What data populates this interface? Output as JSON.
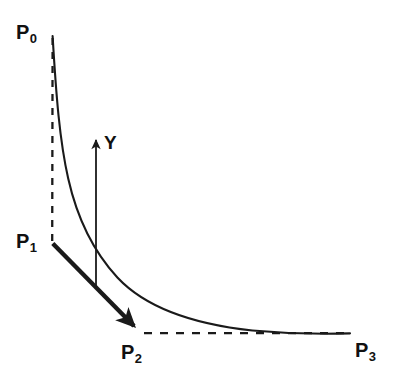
{
  "diagram": {
    "background_color": "#ffffff",
    "stroke_color": "#1a1a1a",
    "labels": {
      "p0": {
        "base": "P",
        "sub": "0"
      },
      "p1": {
        "base": "P",
        "sub": "1"
      },
      "p2": {
        "base": "P",
        "sub": "2"
      },
      "p3": {
        "base": "P",
        "sub": "3"
      },
      "y": "Y"
    },
    "points": {
      "p0": {
        "x": 52,
        "y": 36
      },
      "p1": {
        "x": 52,
        "y": 243
      },
      "p2": {
        "x": 141,
        "y": 333
      },
      "p3": {
        "x": 350,
        "y": 333
      }
    },
    "curve": {
      "name": "convex-decreasing-curve",
      "style": "solid",
      "stroke_width": 2.1,
      "path": "M 52.5 36 C 56 96 59.5 140 68 178 C 77 218 93 251 117 277 C 146 308 196 324 252 330 C 292 334 325 334 350 333.5"
    },
    "chord": {
      "name": "p1-to-p2-arrow",
      "style": "solid-thick-arrow",
      "stroke_width": 4.4,
      "from": "p1",
      "to": "p2"
    },
    "vertical_dashed": {
      "name": "p0-to-p1-dashed",
      "style": "dashed",
      "stroke_width": 2.3,
      "dash_pattern": "7 7",
      "from": "p0",
      "to": "p1"
    },
    "horizontal_dashed": {
      "name": "p2-to-p3-dashed",
      "style": "dashed",
      "stroke_width": 2.3,
      "dash_pattern": "8 8",
      "from": "p2",
      "to": "p3"
    },
    "y_arrow": {
      "name": "y-vertical-arrow",
      "style": "solid-arrow-up",
      "stroke_width": 1.8,
      "x": 96,
      "y_top": 133,
      "y_bottom": 286
    }
  }
}
